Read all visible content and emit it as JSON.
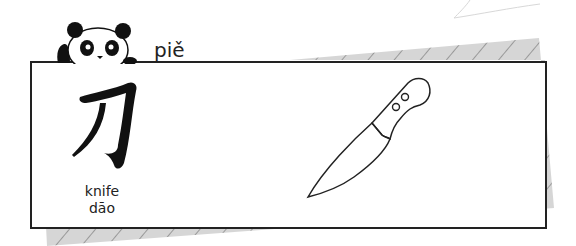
{
  "card": {
    "character": "刀",
    "meaning": "knife",
    "pinyin": "dāo"
  },
  "header": {
    "sound_label": "piě"
  },
  "colors": {
    "border": "#222222",
    "shadow": "#d6d6d6",
    "hatch": "#8a8a8a"
  },
  "icons": {
    "mascot": "panda-icon",
    "illustration": "knife-icon"
  }
}
